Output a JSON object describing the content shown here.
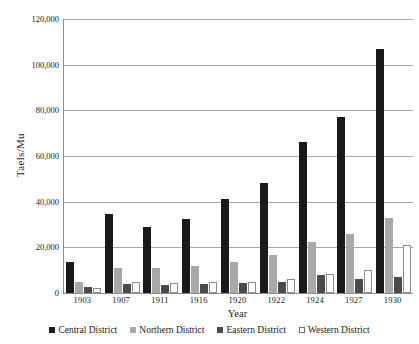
{
  "chart_data": {
    "type": "bar",
    "title": "",
    "xlabel": "Year",
    "ylabel": "Taels/Mu",
    "ylim": [
      0,
      120000
    ],
    "ytick_step": 20000,
    "ytick_labels": [
      "120,000",
      "100,000",
      "80,000",
      "60,000",
      "40,000",
      "20,000",
      "0"
    ],
    "ytick_values": [
      120000,
      100000,
      80000,
      60000,
      40000,
      20000,
      0
    ],
    "grid": true,
    "legend_position": "bottom",
    "categories": [
      "1903",
      "1907",
      "1911",
      "1916",
      "1920",
      "1922",
      "1924",
      "1927",
      "1930"
    ],
    "series": [
      {
        "name": "Central District",
        "color": "#1a1a1a",
        "values": [
          13500,
          34500,
          29000,
          32500,
          41000,
          48000,
          66000,
          77000,
          107000
        ]
      },
      {
        "name": "Northern District",
        "color": "#a8a8a8",
        "values": [
          5000,
          11000,
          11000,
          12000,
          13500,
          16500,
          22500,
          26000,
          33000
        ]
      },
      {
        "name": "Eastern District",
        "color": "#4a4a4a",
        "values": [
          2500,
          4000,
          3500,
          4000,
          4500,
          5000,
          8000,
          6000,
          7000
        ]
      },
      {
        "name": "Western District",
        "color": "#ffffff",
        "values": [
          2000,
          5000,
          4500,
          5000,
          5000,
          6000,
          8500,
          10000,
          21000
        ]
      }
    ]
  }
}
